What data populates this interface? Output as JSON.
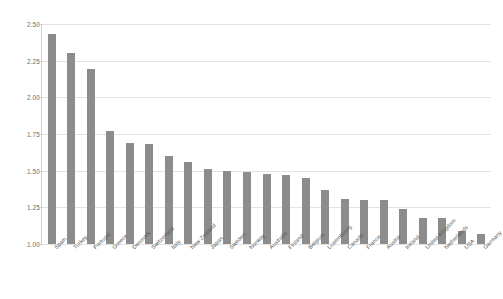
{
  "chart_data": {
    "type": "bar",
    "title": "",
    "subtitle": "",
    "xlabel": "",
    "ylabel": "",
    "ylim": [
      1.0,
      2.5
    ],
    "yticks": [
      "1.00",
      "1.25",
      "1.50",
      "1.75",
      "2.00",
      "2.25",
      "2.50"
    ],
    "ytick_values": [
      1.0,
      1.25,
      1.5,
      1.75,
      2.0,
      2.25,
      2.5
    ],
    "grid": true,
    "legend": "none",
    "bar_color": "#8c8c8c",
    "grid_color": "#e3e3e3",
    "axis_color": "#c8c8c8",
    "tick_label_color": "#6e6e6e",
    "categories": [
      "Spain",
      "Turkey",
      "Portugal",
      "Greece",
      "Denmark",
      "Switzerland",
      "Italy",
      "New Zealand",
      "Japan",
      "Sweden",
      "Norway",
      "Australia",
      "Finland",
      "Belgium",
      "Luxembourg",
      "Canada",
      "France",
      "Austria",
      "Ireland",
      "United Kingdom",
      "Netherlands",
      "USA",
      "Germany"
    ],
    "values": [
      2.43,
      2.3,
      2.19,
      1.77,
      1.69,
      1.68,
      1.6,
      1.56,
      1.51,
      1.5,
      1.49,
      1.48,
      1.47,
      1.45,
      1.37,
      1.31,
      1.3,
      1.3,
      1.24,
      1.18,
      1.18,
      1.09,
      1.07
    ]
  }
}
